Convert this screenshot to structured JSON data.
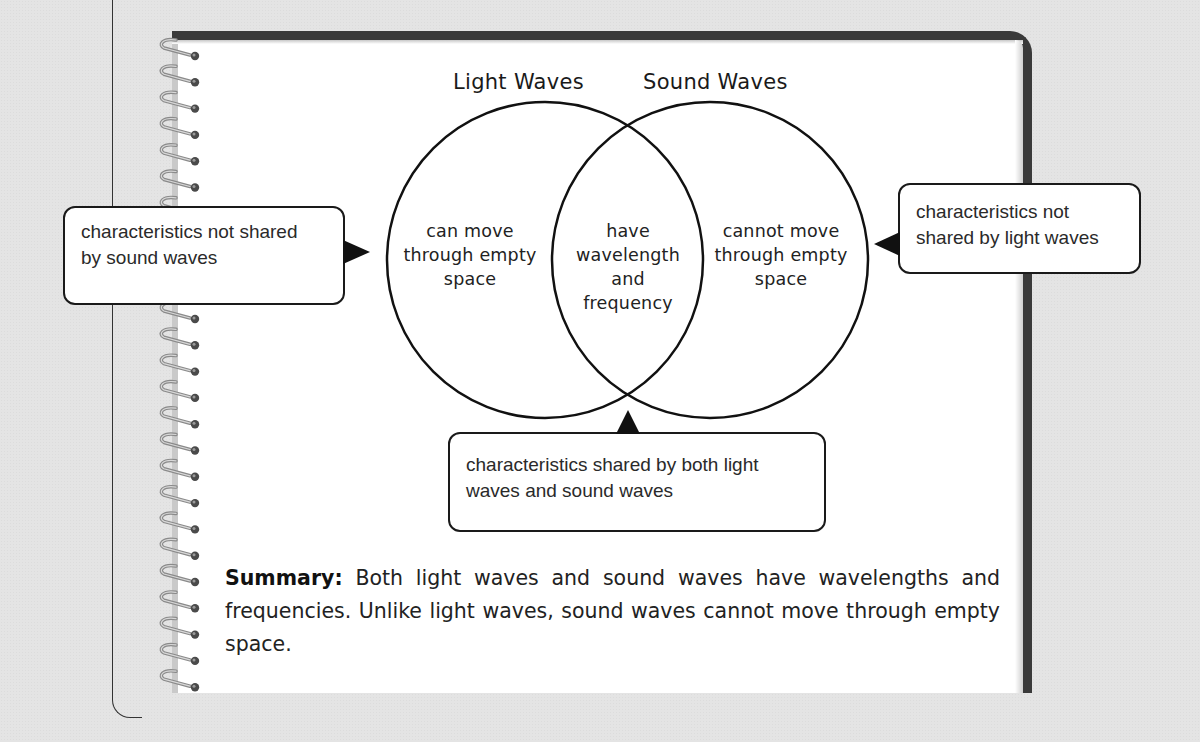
{
  "diagram": {
    "type": "venn",
    "sets": [
      {
        "title": "Light Waves",
        "unique": "can move through empty space",
        "lines": [
          "can move",
          "through empty",
          "space"
        ]
      },
      {
        "title": "Sound Waves",
        "unique": "cannot move through empty space",
        "lines": [
          "cannot move",
          "through empty",
          "space"
        ]
      }
    ],
    "intersection": {
      "text": "have wavelength and frequency",
      "lines": [
        "have",
        "wavelength",
        "and",
        "frequency"
      ]
    }
  },
  "callouts": {
    "left": {
      "lines": [
        "characteristics not shared",
        "by sound waves"
      ]
    },
    "right": {
      "lines": [
        "characteristics not",
        "shared by light waves"
      ]
    },
    "bottom": {
      "lines": [
        "characteristics shared by both light",
        "waves and sound waves"
      ]
    }
  },
  "summary": {
    "label": "Summary:",
    "text": " Both light waves and sound waves have wavelengths and frequencies. Unlike light waves, sound waves cannot move through empty space."
  },
  "colors": {
    "background": "#e4e4e4",
    "page": "#ffffff",
    "border": "#3a3a3a",
    "ink": "#1a1a1a"
  }
}
